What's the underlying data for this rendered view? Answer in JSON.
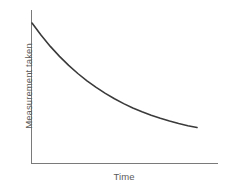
{
  "chart_data": {
    "type": "line",
    "title": "",
    "subtitle": "",
    "xlabel": "Time",
    "ylabel": "Measurement taken",
    "legend": [],
    "legend_position": "none",
    "grid": false,
    "axis_ticks": false,
    "tick_labels_x": [],
    "tick_labels_y": [],
    "xlim": [
      0,
      10
    ],
    "ylim": [
      0,
      10
    ],
    "series": [
      {
        "name": "Measurement taken",
        "color": "#3a3a3a",
        "x": [
          0.0,
          0.5,
          1.0,
          1.5,
          2.0,
          2.5,
          3.0,
          3.5,
          4.0,
          4.5,
          5.0,
          5.5,
          6.0,
          6.5,
          7.0,
          7.5,
          8.0,
          8.5,
          9.0
        ],
        "values": [
          9.15,
          8.35,
          7.62,
          6.97,
          6.38,
          5.85,
          5.37,
          4.94,
          4.55,
          4.2,
          3.88,
          3.6,
          3.35,
          3.12,
          2.92,
          2.74,
          2.58,
          2.44,
          2.32
        ]
      }
    ]
  },
  "axes": {
    "line_color": "#7a7a7a",
    "line_width": 1,
    "curve_color": "#3a3a3a",
    "curve_width": 1.6,
    "background": "#ffffff",
    "label_color": "#5a5a5a"
  },
  "geometry": {
    "origin_x": 31,
    "origin_y": 163,
    "y_axis_top": 10,
    "x_axis_right": 218,
    "curve_start": [
      32,
      23
    ],
    "curve_end": [
      197,
      141
    ]
  }
}
